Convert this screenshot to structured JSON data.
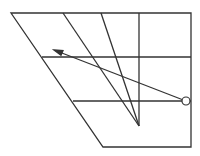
{
  "diagram": {
    "type": "geometric-line-diagram",
    "stroke_color": "#333333",
    "background": "#ffffff",
    "outline": {
      "points": [
        [
          11,
          13
        ],
        [
          191,
          13
        ],
        [
          191,
          147
        ],
        [
          103,
          147
        ]
      ]
    },
    "horizontal_lines": [
      {
        "y": 57,
        "x1": 42,
        "x2": 191
      },
      {
        "y": 101,
        "x1": 73,
        "x2": 191
      }
    ],
    "vertical_line": {
      "x": 139,
      "y1": 13,
      "y2": 126
    },
    "converging_lines": [
      {
        "from": [
          63,
          13
        ],
        "to": [
          139,
          126
        ]
      },
      {
        "from": [
          101,
          13
        ],
        "to": [
          139,
          126
        ]
      }
    ],
    "vertex": [
      139,
      126
    ],
    "arrow": {
      "from": [
        186,
        101
      ],
      "to": [
        54,
        50
      ]
    },
    "circle": {
      "cx": 186,
      "cy": 101,
      "r": 4
    }
  }
}
